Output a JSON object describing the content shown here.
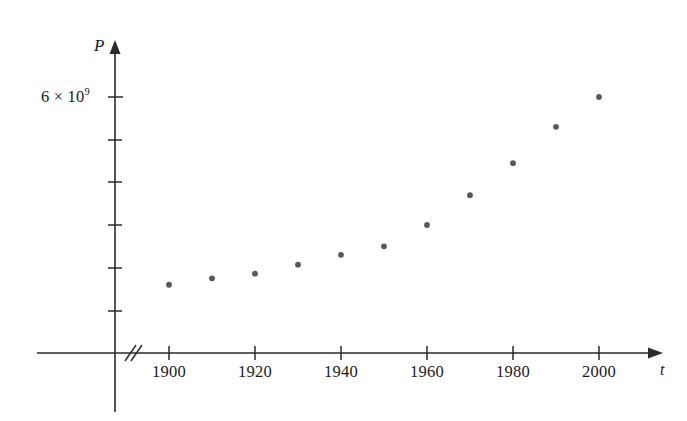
{
  "figure": {
    "name": "population-scatter-plot",
    "background_color": "#ffffff",
    "ink_color": "#2a2a2a",
    "point_color": "#595959"
  },
  "axes": {
    "y_axis_name": "P",
    "x_axis_name": "t",
    "y_tick_label": "6 × 10",
    "y_tick_exponent": "9",
    "axis_break_marker": "//"
  },
  "chart_data": {
    "type": "scatter",
    "title": "",
    "subtitle": "",
    "xlabel": "t",
    "ylabel": "P",
    "grid": false,
    "legend": "none",
    "x": [
      1900,
      1910,
      1920,
      1930,
      1940,
      1950,
      1960,
      1970,
      1980,
      1990,
      2000
    ],
    "values": [
      1600000000.0,
      1750000000.0,
      1860000000.0,
      2070000000.0,
      2300000000.0,
      2500000000.0,
      3000000000.0,
      3700000000.0,
      4450000000.0,
      5300000000.0,
      6000000000.0
    ],
    "points": [
      {
        "x": 1900,
        "y": 1600000000.0
      },
      {
        "x": 1910,
        "y": 1750000000.0
      },
      {
        "x": 1920,
        "y": 1860000000.0
      },
      {
        "x": 1930,
        "y": 2070000000.0
      },
      {
        "x": 1940,
        "y": 2300000000.0
      },
      {
        "x": 1950,
        "y": 2500000000.0
      },
      {
        "x": 1960,
        "y": 3000000000.0
      },
      {
        "x": 1970,
        "y": 3700000000.0
      },
      {
        "x": 1980,
        "y": 4450000000.0
      },
      {
        "x": 1990,
        "y": 5300000000.0
      },
      {
        "x": 2000,
        "y": 6000000000.0
      }
    ],
    "xlim": [
      1890,
      2010
    ],
    "ylim": [
      0,
      7000000000
    ],
    "x_tick_labels": [
      "1900",
      "1920",
      "1940",
      "1960",
      "1980",
      "2000"
    ],
    "x_tick_values": [
      1900,
      1920,
      1940,
      1960,
      1980,
      2000
    ],
    "y_tick_labels": [
      "6 × 10⁹"
    ],
    "y_tick_values": [
      6000000000
    ],
    "y_minor_tick_values": [
      1000000000,
      2000000000,
      3000000000,
      4000000000,
      5000000000
    ]
  }
}
